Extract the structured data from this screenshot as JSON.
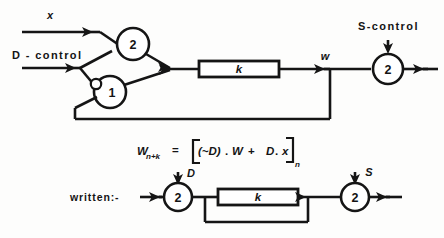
{
  "figure": {
    "ink_color": "#151515",
    "background_color": "#fdfdfc"
  },
  "top_diagram": {
    "input_x_label": "x",
    "input_d_control_label": "D - control",
    "gate_and_label": "2",
    "gate_or_label": "1",
    "delay_box_label": "k",
    "signal_w_label": "w",
    "input_s_control_label": "S-control",
    "gate_s_label": "2"
  },
  "equation": {
    "lhs_main": "W",
    "lhs_sub": "n+k",
    "equals": "=",
    "bracket_open": "[",
    "term_not_d": "(~D)",
    "dot1": ".",
    "term_w": "W",
    "plus": "+",
    "term_d": "D",
    "dot2": ".",
    "term_x": "x",
    "bracket_close": "]",
    "bracket_sub": "n",
    "full_text": "W(n+k) = [(~D).W + D.x](n)"
  },
  "bottom_diagram": {
    "prefix_label": "written:-",
    "gate_d_label": "2",
    "input_d_label": "D",
    "delay_box_label": "k",
    "gate_s_label": "2",
    "input_s_label": "S"
  },
  "icons": {
    "arrow": "arrow-head-icon",
    "inversion_bubble": "inversion-bubble-icon",
    "junction": "wire-junction-icon"
  }
}
